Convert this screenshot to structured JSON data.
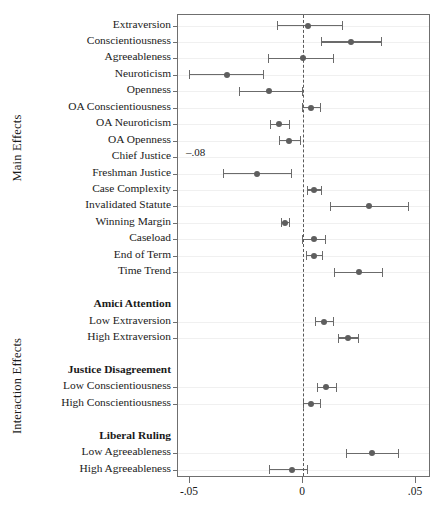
{
  "figure": {
    "type": "coefficient-plot",
    "group_axis_labels": [
      {
        "text": "Main Effects",
        "group": "main"
      },
      {
        "text": "Interaction Effects",
        "group": "interaction"
      }
    ]
  },
  "chart_data": {
    "type": "scatter",
    "title": "",
    "xlabel": "",
    "ylabel": "",
    "xlim": [
      -0.05,
      0.05
    ],
    "grid": true,
    "legend": null,
    "zero_reference_line": 0,
    "xticks": [
      -0.05,
      0,
      0.05
    ],
    "xticklabels": [
      "-.05",
      "0",
      ".05"
    ],
    "sections": [
      {
        "label": "Main Effects",
        "kind": "axis-group"
      },
      {
        "label": "Interaction Effects",
        "kind": "axis-group"
      }
    ],
    "rows": [
      {
        "label": "Extraversion",
        "kind": "estimate",
        "estimate": 0.0022,
        "ci_low": -0.0115,
        "ci_high": 0.0173
      },
      {
        "label": "Conscientiousness",
        "kind": "estimate",
        "estimate": 0.0212,
        "ci_low": 0.008,
        "ci_high": 0.0345
      },
      {
        "label": "Agreeableness",
        "kind": "estimate",
        "estimate": -0.0002,
        "ci_low": -0.0155,
        "ci_high": 0.0132
      },
      {
        "label": "Neuroticism",
        "kind": "estimate",
        "estimate": -0.0336,
        "ci_low": -0.0504,
        "ci_high": -0.0177
      },
      {
        "label": "Openness",
        "kind": "estimate",
        "estimate": -0.015,
        "ci_low": -0.0283,
        "ci_high": -0.0004
      },
      {
        "label": "OA Conscientiousness",
        "kind": "estimate",
        "estimate": 0.0035,
        "ci_low": -0.0004,
        "ci_high": 0.0075
      },
      {
        "label": "OA Neuroticism",
        "kind": "estimate",
        "estimate": -0.0106,
        "ci_low": -0.0146,
        "ci_high": -0.0062
      },
      {
        "label": "OA Openness",
        "kind": "estimate",
        "estimate": -0.0062,
        "ci_low": -0.0106,
        "ci_high": -0.0013
      },
      {
        "label": "Chief Justice",
        "kind": "off-scale",
        "estimate": -0.08,
        "off_scale_text": "–.08"
      },
      {
        "label": "Freshman Justice",
        "kind": "estimate",
        "estimate": -0.0204,
        "ci_low": -0.0354,
        "ci_high": -0.0053
      },
      {
        "label": "Case Complexity",
        "kind": "estimate",
        "estimate": 0.0049,
        "ci_low": 0.0018,
        "ci_high": 0.008
      },
      {
        "label": "Invalidated Statute",
        "kind": "estimate",
        "estimate": 0.0292,
        "ci_low": 0.0119,
        "ci_high": 0.0465
      },
      {
        "label": "Winning Margin",
        "kind": "estimate",
        "estimate": -0.008,
        "ci_low": -0.0097,
        "ci_high": -0.0062
      },
      {
        "label": "Caseload",
        "kind": "estimate",
        "estimate": 0.0049,
        "ci_low": -0.0004,
        "ci_high": 0.0097
      },
      {
        "label": "End of Term",
        "kind": "estimate",
        "estimate": 0.0049,
        "ci_low": 0.0013,
        "ci_high": 0.0084
      },
      {
        "label": "Time Trend",
        "kind": "estimate",
        "estimate": 0.0248,
        "ci_low": 0.0137,
        "ci_high": 0.035
      },
      {
        "label": "",
        "kind": "spacer"
      },
      {
        "label": "Amici Attention",
        "kind": "header"
      },
      {
        "label": "Low Extraversion",
        "kind": "estimate",
        "estimate": 0.0093,
        "ci_low": 0.0053,
        "ci_high": 0.0133
      },
      {
        "label": "High Extraversion",
        "kind": "estimate",
        "estimate": 0.0199,
        "ci_low": 0.0155,
        "ci_high": 0.0243
      },
      {
        "label": "",
        "kind": "spacer"
      },
      {
        "label": "Justice Disagreement",
        "kind": "header"
      },
      {
        "label": "Low Conscientiousness",
        "kind": "estimate",
        "estimate": 0.0102,
        "ci_low": 0.0062,
        "ci_high": 0.0146
      },
      {
        "label": "High Conscientiousness",
        "kind": "estimate",
        "estimate": 0.0035,
        "ci_low": 0.0,
        "ci_high": 0.0075
      },
      {
        "label": "",
        "kind": "spacer"
      },
      {
        "label": "Liberal Ruling",
        "kind": "header"
      },
      {
        "label": "Low Agreeableness",
        "kind": "estimate",
        "estimate": 0.0305,
        "ci_low": 0.019,
        "ci_high": 0.042
      },
      {
        "label": "High Agreeableness",
        "kind": "estimate",
        "estimate": -0.0049,
        "ci_low": -0.015,
        "ci_high": 0.0018
      }
    ]
  },
  "colors": {
    "point": "#5e5e5e",
    "interval": "#6b6b6b",
    "zero_line": "#5a5a5a",
    "frame": "#6f6f6f",
    "grid": "#f0f0f0",
    "text": "#1a1a1a",
    "background": "#ffffff"
  }
}
